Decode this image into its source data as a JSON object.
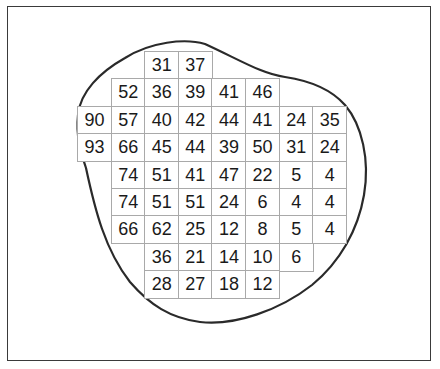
{
  "diagram": {
    "type": "grid-in-outline",
    "colors": {
      "outline": "#2a2a2a",
      "grid_line": "#a9a9a9",
      "text": "#1a1a1a",
      "background": "#ffffff"
    },
    "grid": {
      "columns": 8,
      "rows": 9,
      "origin": {
        "x": 77,
        "y": 51
      },
      "cell_width": 33.6,
      "cell_height": 27.4,
      "cells": [
        {
          "row": 0,
          "col": 2,
          "value": "31"
        },
        {
          "row": 0,
          "col": 3,
          "value": "37"
        },
        {
          "row": 1,
          "col": 1,
          "value": "52"
        },
        {
          "row": 1,
          "col": 2,
          "value": "36"
        },
        {
          "row": 1,
          "col": 3,
          "value": "39"
        },
        {
          "row": 1,
          "col": 4,
          "value": "41"
        },
        {
          "row": 1,
          "col": 5,
          "value": "46"
        },
        {
          "row": 2,
          "col": 0,
          "value": "90"
        },
        {
          "row": 2,
          "col": 1,
          "value": "57"
        },
        {
          "row": 2,
          "col": 2,
          "value": "40"
        },
        {
          "row": 2,
          "col": 3,
          "value": "42"
        },
        {
          "row": 2,
          "col": 4,
          "value": "44"
        },
        {
          "row": 2,
          "col": 5,
          "value": "41"
        },
        {
          "row": 2,
          "col": 6,
          "value": "24"
        },
        {
          "row": 2,
          "col": 7,
          "value": "35"
        },
        {
          "row": 3,
          "col": 0,
          "value": "93"
        },
        {
          "row": 3,
          "col": 1,
          "value": "66"
        },
        {
          "row": 3,
          "col": 2,
          "value": "45"
        },
        {
          "row": 3,
          "col": 3,
          "value": "44"
        },
        {
          "row": 3,
          "col": 4,
          "value": "39"
        },
        {
          "row": 3,
          "col": 5,
          "value": "50"
        },
        {
          "row": 3,
          "col": 6,
          "value": "31"
        },
        {
          "row": 3,
          "col": 7,
          "value": "24"
        },
        {
          "row": 4,
          "col": 1,
          "value": "74"
        },
        {
          "row": 4,
          "col": 2,
          "value": "51"
        },
        {
          "row": 4,
          "col": 3,
          "value": "41"
        },
        {
          "row": 4,
          "col": 4,
          "value": "47"
        },
        {
          "row": 4,
          "col": 5,
          "value": "22"
        },
        {
          "row": 4,
          "col": 6,
          "value": "5"
        },
        {
          "row": 4,
          "col": 7,
          "value": "4"
        },
        {
          "row": 5,
          "col": 1,
          "value": "74"
        },
        {
          "row": 5,
          "col": 2,
          "value": "51"
        },
        {
          "row": 5,
          "col": 3,
          "value": "51"
        },
        {
          "row": 5,
          "col": 4,
          "value": "24"
        },
        {
          "row": 5,
          "col": 5,
          "value": "6"
        },
        {
          "row": 5,
          "col": 6,
          "value": "4"
        },
        {
          "row": 5,
          "col": 7,
          "value": "4"
        },
        {
          "row": 6,
          "col": 1,
          "value": "66"
        },
        {
          "row": 6,
          "col": 2,
          "value": "62"
        },
        {
          "row": 6,
          "col": 3,
          "value": "25"
        },
        {
          "row": 6,
          "col": 4,
          "value": "12"
        },
        {
          "row": 6,
          "col": 5,
          "value": "8"
        },
        {
          "row": 6,
          "col": 6,
          "value": "5"
        },
        {
          "row": 6,
          "col": 7,
          "value": "4"
        },
        {
          "row": 7,
          "col": 2,
          "value": "36"
        },
        {
          "row": 7,
          "col": 3,
          "value": "21"
        },
        {
          "row": 7,
          "col": 4,
          "value": "14"
        },
        {
          "row": 7,
          "col": 5,
          "value": "10"
        },
        {
          "row": 7,
          "col": 6,
          "value": "6"
        },
        {
          "row": 8,
          "col": 2,
          "value": "28"
        },
        {
          "row": 8,
          "col": 3,
          "value": "27"
        },
        {
          "row": 8,
          "col": 4,
          "value": "18"
        },
        {
          "row": 8,
          "col": 5,
          "value": "12"
        }
      ]
    }
  }
}
